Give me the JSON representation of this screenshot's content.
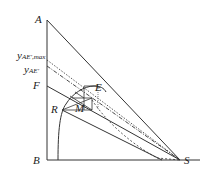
{
  "diagram": {
    "type": "ternary-right-triangle extraction diagram",
    "points": {
      "A": {
        "label": "A"
      },
      "B": {
        "label": "B"
      },
      "S": {
        "label": "S"
      },
      "F": {
        "label": "F"
      },
      "E": {
        "label": "E"
      },
      "R": {
        "label": "R"
      },
      "M": {
        "label": "M"
      }
    },
    "axis_labels": {
      "y_ae_max": {
        "main": "y",
        "sub": "AE',max"
      },
      "y_ae": {
        "main": "y",
        "sub": "AE'"
      }
    },
    "colors": {
      "line": "#333333",
      "background": "#ffffff"
    }
  }
}
